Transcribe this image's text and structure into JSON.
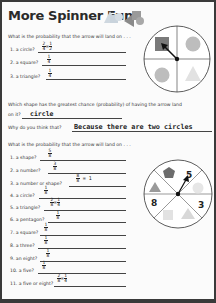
{
  "title": "More Spinner Fun",
  "section1": {
    "prompt": "What is the probability that the arrow will land on . . .",
    "questions": [
      {
        "label": "1. a circle?",
        "answer_num": "2",
        "answer_den": "4",
        "simplified_num": "1",
        "simplified_den": "2"
      },
      {
        "label": "2. a square?",
        "answer_num": "1",
        "answer_den": "4"
      },
      {
        "label": "3. a triangle?",
        "answer_num": "1",
        "answer_den": "4"
      }
    ],
    "greatest_prompt_line1": "Which shape has the greatest chance (probability) of having the arrow land",
    "greatest_prompt_line2": "on it?",
    "greatest_answer": "circle",
    "why_prompt": "Why do you think that?",
    "why_answer": "Because there are two circles"
  },
  "spinner1": {
    "sectors": [
      "square",
      "circle",
      "circle",
      "triangle"
    ],
    "colors": {
      "square": "#7a7a7a",
      "circle": "#bdbdbd",
      "triangle": "#e0e0e0"
    }
  },
  "section2": {
    "prompt": "What is the probability that the arrow will land on . . .",
    "questions": [
      {
        "label": "1. a shape?",
        "answer_num": "5",
        "answer_den": "8"
      },
      {
        "label": "2. a number?",
        "answer_num": "3",
        "answer_den": "8"
      },
      {
        "label": "3. a number or shape?",
        "answer_num": "8",
        "answer_den": "8",
        "equals": "= 1"
      },
      {
        "label": "4. a circle?",
        "answer_num": "1",
        "answer_den": "8"
      },
      {
        "label": "5. a triangle?",
        "answer_num": "2",
        "answer_den": "8",
        "simplified_num": "1",
        "simplified_den": "4"
      },
      {
        "label": "6. a pentagon?",
        "answer_num": "1",
        "answer_den": "8"
      },
      {
        "label": "7. a square?",
        "answer_num": "1",
        "answer_den": "8"
      },
      {
        "label": "8. a three?",
        "answer_num": "1",
        "answer_den": "8"
      },
      {
        "label": "9. an eight?",
        "answer_num": "1",
        "answer_den": "8"
      },
      {
        "label": "10. a five?",
        "answer_num": "1",
        "answer_den": "8"
      },
      {
        "label": "11. a five or eight?",
        "answer_num": "2",
        "answer_den": "8",
        "simplified_num": "1",
        "simplified_den": "4"
      }
    ]
  },
  "spinner2": {
    "numbers": [
      "5",
      "3",
      "8"
    ],
    "shapes": [
      "pentagon",
      "circle",
      "triangle",
      "square",
      "triangle"
    ]
  }
}
